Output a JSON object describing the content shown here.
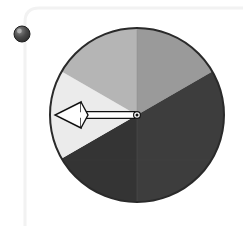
{
  "app": {
    "title": "Spinner Wheel",
    "background_color": "#ffffff"
  },
  "panel": {
    "name": "rounded-panel-outline",
    "border_color": "#f2f2f2",
    "border_width": 3,
    "corner_radius": 14,
    "left_edge_x": 25,
    "top_edge_y": 8
  },
  "knob": {
    "label": "drag-knob",
    "center_x": 22,
    "center_y": 34,
    "radius": 8,
    "color_light": "#8a8a8a",
    "color_dark": "#2e2e2e",
    "outline_color": "#1f1f1f"
  },
  "wheel": {
    "label": "Spinner wheel",
    "center_x": 137,
    "center_y": 115,
    "radius": 87,
    "outline_color": "#2a2a2a",
    "outline_width": 2,
    "divider_color": "#8b8b8b",
    "hub": {
      "label": "wheel-hub",
      "radius": 3.2,
      "fill": "#ffffff",
      "inner_fill": "#111111",
      "stroke": "#111111"
    }
  },
  "pointer": {
    "label": "pointer-arrow",
    "angle_degrees": 180,
    "direction": "left",
    "tip_x": 55,
    "tail_x": 136,
    "y": 115,
    "fill": "#ffffff",
    "stroke": "#111111",
    "stroke_width": 1.4,
    "shaft_half_height": 3.4,
    "head_length": 26,
    "head_half_height": 13,
    "notch_depth": 7
  },
  "chart_data": {
    "type": "pie",
    "title": "Spinner Wheel",
    "xlabel": "",
    "ylabel": "",
    "legend_position": "none",
    "grid": false,
    "center": [
      137,
      115
    ],
    "radius": 87,
    "start_angle_degrees": -90,
    "direction": "clockwise",
    "categories": [
      "segment-top-right",
      "segment-right",
      "segment-bottom-left",
      "segment-left",
      "segment-top-left"
    ],
    "values": [
      60,
      90,
      90,
      60,
      60
    ],
    "colors": [
      "#9a9a9a",
      "#3d3d3d",
      "#343434",
      "#ebebeb",
      "#b5b5b5"
    ],
    "slices": [
      {
        "name": "segment-top-right",
        "color": "#9a9a9a",
        "start_angle_degrees": -90,
        "end_angle_degrees": -30,
        "sweep_degrees": 60
      },
      {
        "name": "segment-right",
        "color": "#3d3d3d",
        "start_angle_degrees": -30,
        "end_angle_degrees": 90,
        "sweep_degrees": 120
      },
      {
        "name": "segment-bottom-left",
        "color": "#343434",
        "start_angle_degrees": 90,
        "end_angle_degrees": 150,
        "sweep_degrees": 60
      },
      {
        "name": "segment-left",
        "color": "#ebebeb",
        "start_angle_degrees": 150,
        "end_angle_degrees": 210,
        "sweep_degrees": 60
      },
      {
        "name": "segment-top-left",
        "color": "#b5b5b5",
        "start_angle_degrees": 210,
        "end_angle_degrees": 270,
        "sweep_degrees": 60
      }
    ],
    "dividers_degrees": [
      -90,
      90
    ],
    "pointer_angle_degrees": 180,
    "selected_slice": "segment-left"
  }
}
